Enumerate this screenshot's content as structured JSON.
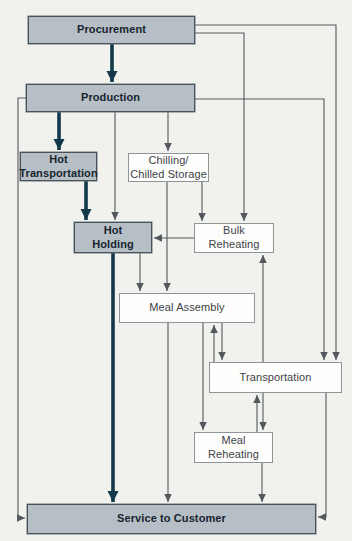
{
  "diagram": {
    "canvas": {
      "width": 352,
      "height": 541,
      "background": "#f1f2ee"
    },
    "colors": {
      "filled_box_fill": "#b6bfc6",
      "filled_box_border": "#49525a",
      "filled_box_text": "#17242e",
      "outline_box_fill": "#fdfdfc",
      "outline_box_border": "#8d959b",
      "outline_box_text": "#3d4347",
      "thick_arrow": "#12384a",
      "thin_arrow": "#53585e"
    },
    "nodes": [
      {
        "id": "procurement",
        "label": "Procurement",
        "x": 28,
        "y": 16,
        "w": 167,
        "h": 28,
        "variant": "filled"
      },
      {
        "id": "production",
        "label": "Production",
        "x": 26,
        "y": 84,
        "w": 169,
        "h": 28,
        "variant": "filled"
      },
      {
        "id": "hot-transportation",
        "label": "Hot\nTransportation",
        "x": 20,
        "y": 152,
        "w": 77,
        "h": 29,
        "variant": "filled"
      },
      {
        "id": "chilled-storage",
        "label": "Chilling/\nChilled Storage",
        "x": 128,
        "y": 153,
        "w": 81,
        "h": 29,
        "variant": "outline"
      },
      {
        "id": "hot-holding",
        "label": "Hot\nHolding",
        "x": 74,
        "y": 222,
        "w": 78,
        "h": 31,
        "variant": "filled"
      },
      {
        "id": "bulk-reheating",
        "label": "Bulk\nReheating",
        "x": 194,
        "y": 223,
        "w": 80,
        "h": 30,
        "variant": "outline"
      },
      {
        "id": "meal-assembly",
        "label": "Meal Assembly",
        "x": 119,
        "y": 293,
        "w": 136,
        "h": 30,
        "variant": "outline"
      },
      {
        "id": "transportation",
        "label": "Transportation",
        "x": 209,
        "y": 362,
        "w": 133,
        "h": 31,
        "variant": "outline"
      },
      {
        "id": "meal-reheating",
        "label": "Meal\nReheating",
        "x": 194,
        "y": 432,
        "w": 79,
        "h": 31,
        "variant": "outline"
      },
      {
        "id": "service-to-customer",
        "label": "Service to Customer",
        "x": 27,
        "y": 504,
        "w": 289,
        "h": 30,
        "variant": "filled"
      }
    ],
    "edges": [
      {
        "name": "arrow-procurement-to-production",
        "thick": true,
        "points": [
          [
            112,
            44
          ],
          [
            112,
            82
          ]
        ]
      },
      {
        "name": "arrow-production-to-hot-transportation",
        "thick": true,
        "points": [
          [
            59,
            112
          ],
          [
            59,
            150
          ]
        ]
      },
      {
        "name": "arrow-hot-transportation-to-hot-holding",
        "thick": true,
        "points": [
          [
            86,
            181
          ],
          [
            86,
            220
          ]
        ]
      },
      {
        "name": "arrow-hot-holding-to-service",
        "thick": true,
        "points": [
          [
            113,
            253
          ],
          [
            113,
            502
          ]
        ]
      },
      {
        "name": "arrow-production-to-hot-holding",
        "thick": false,
        "points": [
          [
            115,
            112
          ],
          [
            115,
            220
          ]
        ]
      },
      {
        "name": "arrow-production-to-chilled-storage",
        "thick": false,
        "points": [
          [
            168,
            112
          ],
          [
            168,
            151
          ]
        ]
      },
      {
        "name": "arrow-chilled-storage-to-meal-assembly",
        "thick": false,
        "points": [
          [
            167,
            182
          ],
          [
            167,
            291
          ]
        ]
      },
      {
        "name": "arrow-chilled-storage-to-bulk-reheating",
        "thick": false,
        "points": [
          [
            202,
            182
          ],
          [
            202,
            221
          ]
        ]
      },
      {
        "name": "arrow-hot-holding-to-meal-assembly",
        "thick": false,
        "points": [
          [
            140,
            253
          ],
          [
            140,
            291
          ]
        ]
      },
      {
        "name": "arrow-procurement-to-transportation",
        "thick": false,
        "points": [
          [
            195,
            25
          ],
          [
            336,
            25
          ],
          [
            336,
            360
          ]
        ]
      },
      {
        "name": "arrow-procurement-to-bulk-reheating",
        "thick": false,
        "points": [
          [
            195,
            33
          ],
          [
            244,
            33
          ],
          [
            244,
            221
          ]
        ]
      },
      {
        "name": "arrow-production-to-transportation",
        "thick": false,
        "points": [
          [
            195,
            99
          ],
          [
            324,
            99
          ],
          [
            324,
            360
          ]
        ]
      },
      {
        "name": "arrow-production-to-service",
        "thick": false,
        "points": [
          [
            26,
            98
          ],
          [
            18,
            98
          ],
          [
            18,
            518
          ],
          [
            25,
            518
          ]
        ]
      },
      {
        "name": "arrow-bulk-reheating-to-hot-holding",
        "thick": false,
        "points": [
          [
            194,
            238
          ],
          [
            154,
            238
          ]
        ]
      },
      {
        "name": "arrow-transportation-to-bulk-reheating",
        "thick": false,
        "points": [
          [
            263,
            362
          ],
          [
            263,
            255
          ]
        ]
      },
      {
        "name": "arrow-meal-assembly-to-transportation",
        "thick": false,
        "points": [
          [
            222,
            323
          ],
          [
            222,
            360
          ]
        ]
      },
      {
        "name": "arrow-transportation-to-meal-assembly",
        "thick": false,
        "points": [
          [
            214,
            362
          ],
          [
            214,
            325
          ]
        ]
      },
      {
        "name": "arrow-meal-assembly-to-meal-reheating",
        "thick": false,
        "points": [
          [
            203,
            323
          ],
          [
            203,
            430
          ]
        ]
      },
      {
        "name": "arrow-meal-assembly-to-service",
        "thick": false,
        "points": [
          [
            168,
            323
          ],
          [
            168,
            502
          ]
        ]
      },
      {
        "name": "arrow-transportation-to-meal-reheating",
        "thick": false,
        "points": [
          [
            263,
            393
          ],
          [
            263,
            430
          ]
        ]
      },
      {
        "name": "arrow-meal-reheating-to-transportation",
        "thick": false,
        "points": [
          [
            257,
            432
          ],
          [
            257,
            395
          ]
        ]
      },
      {
        "name": "arrow-meal-reheating-to-service",
        "thick": false,
        "points": [
          [
            262,
            463
          ],
          [
            262,
            502
          ]
        ]
      },
      {
        "name": "arrow-transportation-to-service",
        "thick": false,
        "points": [
          [
            326,
            393
          ],
          [
            326,
            517
          ],
          [
            318,
            517
          ]
        ]
      }
    ]
  }
}
